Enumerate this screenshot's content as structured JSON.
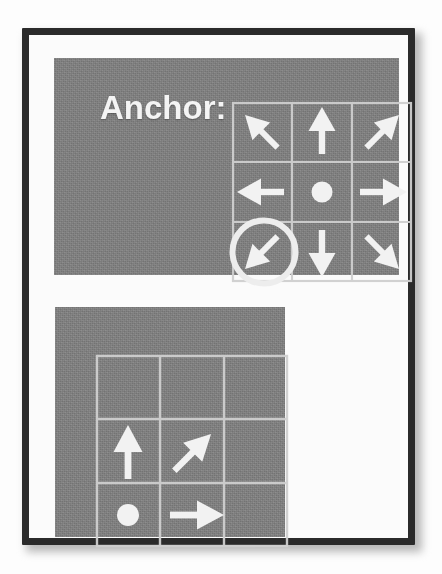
{
  "page": {
    "background_color": "#fdfdfd",
    "frame_color": "#2b2b2b",
    "panel_color": "#818181",
    "ink_color": "#f2f2f2",
    "grid_line_color": "#c9c9c9",
    "highlight_color": "#e8e8e8"
  },
  "top_panel": {
    "label": "Anchor:",
    "grid": {
      "rows": 3,
      "cols": 3,
      "cells": [
        {
          "row": 0,
          "col": 0,
          "glyph": "arrow-up-left",
          "symbol": "↖",
          "highlighted": false
        },
        {
          "row": 0,
          "col": 1,
          "glyph": "arrow-up",
          "symbol": "↑",
          "highlighted": false
        },
        {
          "row": 0,
          "col": 2,
          "glyph": "arrow-up-right",
          "symbol": "↗",
          "highlighted": false
        },
        {
          "row": 1,
          "col": 0,
          "glyph": "arrow-left",
          "symbol": "←",
          "highlighted": false
        },
        {
          "row": 1,
          "col": 1,
          "glyph": "dot",
          "symbol": "●",
          "highlighted": false
        },
        {
          "row": 1,
          "col": 2,
          "glyph": "arrow-right",
          "symbol": "→",
          "highlighted": false
        },
        {
          "row": 2,
          "col": 0,
          "glyph": "arrow-down-left",
          "symbol": "↙",
          "highlighted": true
        },
        {
          "row": 2,
          "col": 1,
          "glyph": "arrow-down",
          "symbol": "↓",
          "highlighted": false
        },
        {
          "row": 2,
          "col": 2,
          "glyph": "arrow-down-right",
          "symbol": "↘",
          "highlighted": false
        }
      ],
      "selected_cell": {
        "row": 2,
        "col": 0,
        "glyph": "arrow-down-left"
      }
    }
  },
  "bottom_panel": {
    "grid": {
      "rows": 3,
      "cols": 3,
      "cells": [
        {
          "row": 0,
          "col": 0,
          "glyph": "empty",
          "symbol": ""
        },
        {
          "row": 0,
          "col": 1,
          "glyph": "empty",
          "symbol": ""
        },
        {
          "row": 0,
          "col": 2,
          "glyph": "empty",
          "symbol": ""
        },
        {
          "row": 1,
          "col": 0,
          "glyph": "arrow-up",
          "symbol": "↑"
        },
        {
          "row": 1,
          "col": 1,
          "glyph": "arrow-up-right",
          "symbol": "↗"
        },
        {
          "row": 1,
          "col": 2,
          "glyph": "empty",
          "symbol": ""
        },
        {
          "row": 2,
          "col": 0,
          "glyph": "dot",
          "symbol": "●"
        },
        {
          "row": 2,
          "col": 1,
          "glyph": "arrow-right",
          "symbol": "→"
        },
        {
          "row": 2,
          "col": 2,
          "glyph": "empty",
          "symbol": ""
        }
      ]
    }
  }
}
